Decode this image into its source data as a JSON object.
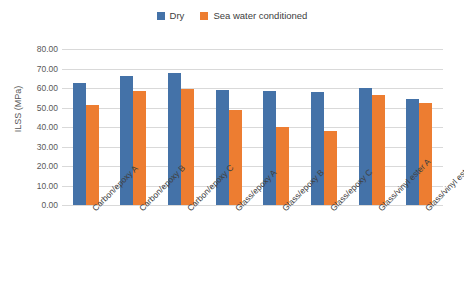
{
  "chart_data": {
    "type": "bar",
    "title": "",
    "subtitle": "",
    "xlabel": "",
    "ylabel": "ILSS (MPa)",
    "ylim": [
      0,
      80
    ],
    "ytick_step": 10,
    "ytick_labels": [
      "80.00",
      "70.00",
      "60.00",
      "50.00",
      "40.00",
      "30.00",
      "20.00",
      "10.00",
      "0.00"
    ],
    "ytick_values": [
      80,
      70,
      60,
      50,
      40,
      30,
      20,
      10,
      0
    ],
    "grid": true,
    "legend_position": "top-center",
    "categories": [
      "Carbon/epoxy A",
      "Carbon/epoxy B",
      "Carbon/epoxy C",
      "Glass/epoxy A",
      "Glass/epoxy B",
      "Glass/epoxy C",
      "Glass/vinyl ester A",
      "Glass/vinyl ester B"
    ],
    "series": [
      {
        "name": "Dry",
        "color": "#4472a8",
        "values": [
          62.5,
          66.0,
          67.7,
          59.0,
          58.5,
          58.0,
          60.0,
          54.5
        ]
      },
      {
        "name": "Sea water conditioned",
        "color": "#ed7d31",
        "values": [
          51.3,
          58.7,
          59.5,
          48.7,
          40.0,
          38.0,
          56.5,
          52.5
        ]
      }
    ]
  },
  "legend": {
    "entries": [
      {
        "label": "Dry",
        "color": "#4472a8"
      },
      {
        "label": "Sea water conditioned",
        "color": "#ed7d31"
      }
    ]
  },
  "axes": {
    "y_title": "ILSS (MPa)"
  }
}
